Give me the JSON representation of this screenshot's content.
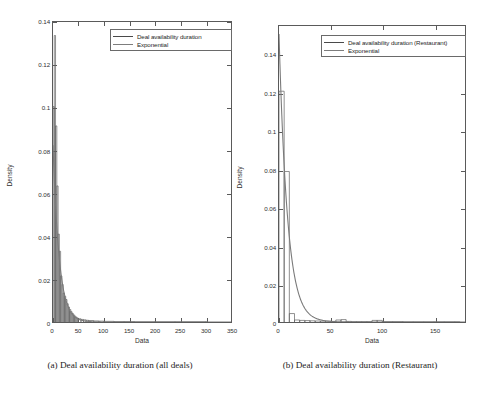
{
  "figure": {
    "panels": [
      {
        "id": "panel-a",
        "caption": "(a)  Deal availability duration (all deals)",
        "legend": [
          {
            "label": "Deal availability duration",
            "style": "thin"
          },
          {
            "label": "Exponential",
            "style": "thick"
          }
        ],
        "chart_data": {
          "type": "bar",
          "title": "",
          "subtitle": "",
          "xlabel": "Data",
          "ylabel": "Density",
          "xlim": [
            0,
            350
          ],
          "ylim": [
            0,
            0.14
          ],
          "xticks": [
            0,
            50,
            100,
            150,
            200,
            250,
            300,
            350
          ],
          "xticklabels": [
            "0",
            "50",
            "100",
            "150",
            "200",
            "250",
            "300",
            "350"
          ],
          "yticks": [
            0,
            0.02,
            0.04,
            0.06,
            0.08,
            0.1,
            0.12,
            0.14
          ],
          "yticklabels": [
            "0",
            "0.02",
            "0.04",
            "0.06",
            "0.08",
            "0.1",
            "0.12",
            "0.14"
          ],
          "grid": false,
          "legend_position": "upper-right",
          "series": [
            {
              "name": "Deal availability duration",
              "type": "histogram",
              "bin_width": 2.5,
              "bin_starts": [
                0,
                2.5,
                5,
                7.5,
                10,
                12.5,
                15,
                17.5,
                20,
                22.5,
                25,
                27.5,
                30,
                32.5,
                35,
                37.5,
                40,
                42.5,
                45,
                47.5,
                50,
                55,
                60,
                65,
                70,
                80,
                90,
                100,
                120,
                140,
                160,
                200,
                240,
                300
              ],
              "values": [
                0.1005,
                0.1337,
                0.0915,
                0.0635,
                0.041,
                0.033,
                0.0215,
                0.0175,
                0.0135,
                0.012,
                0.0105,
                0.0085,
                0.007,
                0.0058,
                0.0048,
                0.004,
                0.0033,
                0.0027,
                0.0022,
                0.0018,
                0.0015,
                0.0012,
                0.001,
                0.0008,
                0.0007,
                0.0005,
                0.0004,
                0.0003,
                0.0002,
                0.0002,
                0.0001,
                0.0001,
                0.0001,
                0.0001
              ]
            },
            {
              "name": "Exponential",
              "type": "line",
              "fit": "exponential",
              "rate": 0.0825,
              "amplitude": 0.0825,
              "x": [
                0,
                5,
                10,
                15,
                20,
                25,
                30,
                40,
                50,
                60,
                80,
                100,
                150,
                200,
                250,
                300,
                350
              ],
              "values": [
                0.0825,
                0.0546,
                0.0362,
                0.024,
                0.0159,
                0.0105,
                0.007,
                0.0031,
                0.0013,
                0.0006,
                0.0001,
                2e-05,
                0.0,
                0.0,
                0.0,
                0.0,
                0.0
              ]
            }
          ]
        }
      },
      {
        "id": "panel-b",
        "caption": "(b)  Deal availability duration (Restaurant)",
        "legend": [
          {
            "label": "Deal availability duration (Restaurant)",
            "style": "thin"
          },
          {
            "label": "Exponential",
            "style": "thick"
          }
        ],
        "chart_data": {
          "type": "bar",
          "title": "",
          "subtitle": "",
          "xlabel": "Data",
          "ylabel": "Density",
          "xlim": [
            0,
            180
          ],
          "ylim": [
            0,
            0.1475
          ],
          "xticks": [
            0,
            50,
            100,
            150
          ],
          "xticklabels": [
            "0",
            "50",
            "100",
            "150"
          ],
          "yticks": [
            0,
            0.02,
            0.04,
            0.06,
            0.08,
            0.1,
            0.12,
            0.14
          ],
          "yticklabels": [
            "0",
            "0.02",
            "0.04",
            "0.06",
            "0.08",
            "0.1",
            "0.12",
            "0.14"
          ],
          "grid": false,
          "legend_position": "upper-right",
          "series": [
            {
              "name": "Deal availability duration (Restaurant)",
              "type": "histogram",
              "bin_width": 5,
              "bin_starts": [
                0,
                5,
                10,
                15,
                20,
                25,
                30,
                35,
                40,
                45,
                50,
                55,
                60,
                65,
                70,
                75,
                80,
                85,
                90,
                95,
                100,
                110,
                120,
                130,
                140,
                150,
                160,
                170
              ],
              "values": [
                0.115,
                0.075,
                0.0042,
                0.001,
                0.0008,
                0.0007,
                0.0006,
                0.0005,
                0.0004,
                0.0004,
                0.0003,
                0.001,
                0.0012,
                0.0003,
                0.0002,
                0.0002,
                0.0002,
                0.0002,
                0.0008,
                0.0008,
                0.0002,
                0.0002,
                0.0001,
                0.0001,
                0.0001,
                0.0001,
                0.0001,
                0.0001
              ]
            },
            {
              "name": "Exponential",
              "type": "line",
              "fit": "exponential",
              "rate": 0.122,
              "amplitude": 0.1435,
              "x": [
                0,
                2,
                5,
                10,
                15,
                20,
                25,
                30,
                40,
                50,
                60,
                80,
                100,
                140,
                180
              ],
              "values": [
                0.1435,
                0.1124,
                0.078,
                0.0424,
                0.023,
                0.0125,
                0.0068,
                0.0037,
                0.0011,
                0.0003,
                0.0001,
                1e-05,
                0.0,
                0.0,
                0.0
              ]
            }
          ]
        }
      }
    ]
  }
}
